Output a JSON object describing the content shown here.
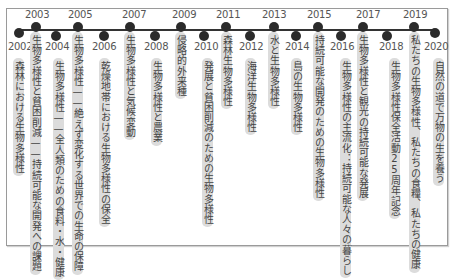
{
  "diagram": {
    "type": "timeline",
    "colors": {
      "line": "#333333",
      "dot": "#2b2b2b",
      "label_bg": "#dcdcdc",
      "frame": "#9a9a9a"
    },
    "events": [
      {
        "year": "2002",
        "theme": "森林における生物多様性"
      },
      {
        "year": "2003",
        "theme": "生物多様性と貧困削減——持続可能な開発への課題"
      },
      {
        "year": "2004",
        "theme": "生物多様性——全人類のための食料・水・健康"
      },
      {
        "year": "2005",
        "theme": "生物多様性——絶えず変化する世界での生命の保障"
      },
      {
        "year": "2006",
        "theme": "乾燥地帯における生物多様性の保全"
      },
      {
        "year": "2007",
        "theme": "生物多様性と気候変動"
      },
      {
        "year": "2008",
        "theme": "生物多様性と農業"
      },
      {
        "year": "2009",
        "theme": "侵略的外来種"
      },
      {
        "year": "2010",
        "theme": "発展と貧困削減のための生物多様性"
      },
      {
        "year": "2011",
        "theme": "森林生物多様性"
      },
      {
        "year": "2012",
        "theme": "海洋生物多様性"
      },
      {
        "year": "2013",
        "theme": "水と生物多様性"
      },
      {
        "year": "2014",
        "theme": "島の生物多様性"
      },
      {
        "year": "2015",
        "theme": "持続可能な開発のための生物多様性"
      },
      {
        "year": "2016",
        "theme": "生物多様性の主流化：持続可能な人々の暮らし"
      },
      {
        "year": "2017",
        "theme": "生物多様性と観光の持続可能な発展"
      },
      {
        "year": "2018",
        "theme": "生物多様性保全活動25周年記念"
      },
      {
        "year": "2019",
        "theme": "私たちの生物多様性、私たちの食糧、私たちの健康"
      },
      {
        "year": "2020",
        "theme": "自然の道で万物の生を養う"
      }
    ]
  }
}
